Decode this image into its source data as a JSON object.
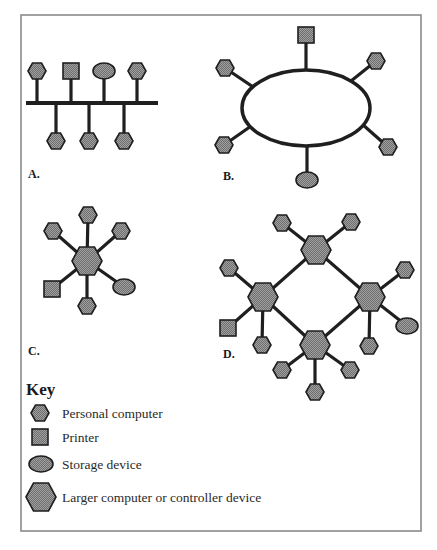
{
  "figure": {
    "type": "network-topology-diagram",
    "colors": {
      "node_fill_light": "#9a9a9a",
      "node_fill_dark": "#5a5a5a",
      "node_outline": "#1e1e1e",
      "link": "#1f1f1f",
      "frame": "#8a8a8a",
      "background": "#ffffff"
    }
  },
  "diagrams": [
    {
      "id": "A",
      "label": "A.",
      "topology": "bus",
      "nodes_top": [
        "personal-computer",
        "printer",
        "storage-device",
        "personal-computer"
      ],
      "nodes_bottom": [
        "personal-computer",
        "personal-computer",
        "personal-computer"
      ]
    },
    {
      "id": "B",
      "label": "B.",
      "topology": "ring",
      "nodes": [
        "printer",
        "personal-computer",
        "personal-computer",
        "personal-computer",
        "personal-computer",
        "storage-device"
      ]
    },
    {
      "id": "C",
      "label": "C.",
      "topology": "star",
      "hub": "larger-computer",
      "nodes": [
        "personal-computer",
        "personal-computer",
        "personal-computer",
        "printer",
        "personal-computer",
        "storage-device"
      ]
    },
    {
      "id": "D",
      "label": "D.",
      "topology": "hierarchical-mesh",
      "hubs": 4,
      "hub_nodes": {
        "top": [
          "personal-computer",
          "personal-computer"
        ],
        "left": [
          "personal-computer",
          "printer",
          "personal-computer"
        ],
        "right": [
          "personal-computer",
          "storage-device",
          "personal-computer"
        ],
        "bottom": [
          "personal-computer",
          "personal-computer",
          "personal-computer"
        ]
      }
    }
  ],
  "key": {
    "title": "Key",
    "items": [
      {
        "icon": "small-hexagon-icon",
        "label": "Personal computer"
      },
      {
        "icon": "square-icon",
        "label": "Printer"
      },
      {
        "icon": "ellipse-icon",
        "label": "Storage device"
      },
      {
        "icon": "large-hexagon-icon",
        "label": "Larger computer or controller device"
      }
    ]
  }
}
